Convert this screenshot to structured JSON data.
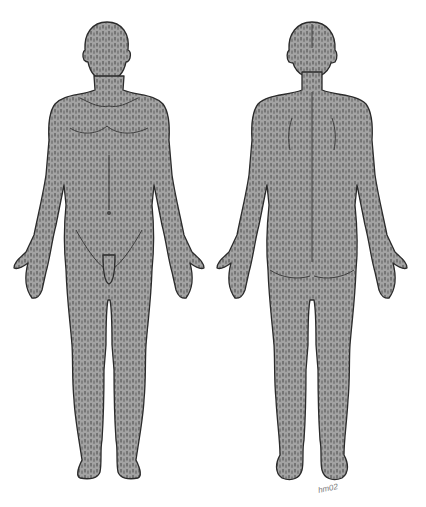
{
  "figure": {
    "views": [
      {
        "id": "anterior",
        "label": "Front view"
      },
      {
        "id": "posterior",
        "label": "Back view"
      }
    ],
    "signature": "hm02",
    "colors": {
      "fill": "#9c9c9c",
      "dash": "#3a3a3a",
      "outline": "#2b2b2b",
      "background": "#ffffff"
    }
  }
}
